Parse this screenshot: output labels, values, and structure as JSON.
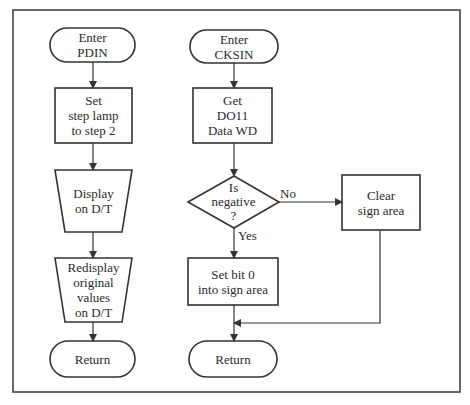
{
  "diagram": {
    "type": "flowchart",
    "frame": {
      "stroke": "#444444"
    },
    "flows": [
      {
        "id": "pdin",
        "nodes": [
          {
            "id": "enter_pdin",
            "shape": "terminator",
            "lines": [
              "Enter",
              "PDIN"
            ]
          },
          {
            "id": "set_step_lamp",
            "shape": "process",
            "lines": [
              "Set",
              "step lamp",
              "to step 2"
            ]
          },
          {
            "id": "display_dt",
            "shape": "manual-operation",
            "lines": [
              "Display",
              "on D/T"
            ]
          },
          {
            "id": "redisplay",
            "shape": "manual-operation",
            "lines": [
              "Redisplay",
              "original",
              "values",
              "on D/T"
            ]
          },
          {
            "id": "return_pdin",
            "shape": "terminator",
            "lines": [
              "Return"
            ]
          }
        ]
      },
      {
        "id": "cksin",
        "nodes": [
          {
            "id": "enter_cksin",
            "shape": "terminator",
            "lines": [
              "Enter",
              "CKSIN"
            ]
          },
          {
            "id": "get_do11",
            "shape": "process",
            "lines": [
              "Get",
              "DO11",
              "Data WD"
            ]
          },
          {
            "id": "is_negative",
            "shape": "decision",
            "lines": [
              "Is",
              "negative",
              "?"
            ]
          },
          {
            "id": "clear_sign",
            "shape": "process",
            "lines": [
              "Clear",
              "sign area"
            ]
          },
          {
            "id": "set_bit0",
            "shape": "process",
            "lines": [
              "Set bit 0",
              "into sign area"
            ]
          },
          {
            "id": "return_cksin",
            "shape": "terminator",
            "lines": [
              "Return"
            ]
          }
        ]
      }
    ],
    "edges": [
      {
        "from": "enter_pdin",
        "to": "set_step_lamp",
        "label": ""
      },
      {
        "from": "set_step_lamp",
        "to": "display_dt",
        "label": ""
      },
      {
        "from": "display_dt",
        "to": "redisplay",
        "label": ""
      },
      {
        "from": "redisplay",
        "to": "return_pdin",
        "label": ""
      },
      {
        "from": "enter_cksin",
        "to": "get_do11",
        "label": ""
      },
      {
        "from": "get_do11",
        "to": "is_negative",
        "label": ""
      },
      {
        "from": "is_negative",
        "to": "clear_sign",
        "label": "No"
      },
      {
        "from": "is_negative",
        "to": "set_bit0",
        "label": "Yes"
      },
      {
        "from": "set_bit0",
        "to": "return_cksin",
        "label": ""
      },
      {
        "from": "clear_sign",
        "to": "return_cksin",
        "label": ""
      }
    ],
    "edge_labels": {
      "no": "No",
      "yes": "Yes"
    }
  }
}
